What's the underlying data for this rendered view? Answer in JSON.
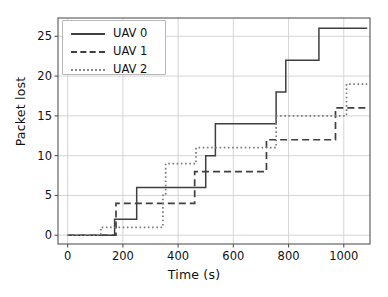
{
  "chart_data": {
    "type": "line",
    "subtype": "step",
    "title": "",
    "xlabel": "Time (s)",
    "ylabel": "Packet lost",
    "xlim": [
      -35,
      1095
    ],
    "ylim": [
      -1.1,
      27.3
    ],
    "xticks": [
      0,
      200,
      400,
      600,
      800,
      1000
    ],
    "yticks": [
      0,
      5,
      10,
      15,
      20,
      25
    ],
    "grid": true,
    "legend_position": "upper left",
    "series": [
      {
        "name": "UAV 0",
        "style": "solid",
        "color": "#3f3f3f",
        "x": [
          0,
          170,
          170,
          175,
          250,
          250,
          500,
          500,
          535,
          535,
          755,
          755,
          790,
          790,
          910,
          910,
          1085
        ],
        "y": [
          0,
          0,
          2,
          2,
          2,
          6,
          6,
          10,
          10,
          14,
          14,
          18,
          18,
          22,
          22,
          26,
          26
        ],
        "steps": [
          {
            "t": 0,
            "value": 0
          },
          {
            "t": 170,
            "value": 2
          },
          {
            "t": 250,
            "value": 6
          },
          {
            "t": 500,
            "value": 10
          },
          {
            "t": 535,
            "value": 14
          },
          {
            "t": 755,
            "value": 18
          },
          {
            "t": 790,
            "value": 22
          },
          {
            "t": 910,
            "value": 26
          }
        ],
        "final_value": 26
      },
      {
        "name": "UAV 1",
        "style": "dashed",
        "color": "#3f3f3f",
        "x": [
          0,
          130,
          130,
          175,
          175,
          460,
          460,
          720,
          720,
          970,
          970,
          1085
        ],
        "y": [
          0,
          0,
          0,
          0,
          4,
          4,
          8,
          8,
          12,
          12,
          16,
          16
        ],
        "steps": [
          {
            "t": 0,
            "value": 0
          },
          {
            "t": 175,
            "value": 4
          },
          {
            "t": 460,
            "value": 8
          },
          {
            "t": 720,
            "value": 12
          },
          {
            "t": 970,
            "value": 16
          }
        ],
        "final_value": 16
      },
      {
        "name": "UAV 2",
        "style": "dotted",
        "color": "#7a7a7a",
        "x": [
          0,
          120,
          120,
          345,
          345,
          355,
          355,
          465,
          465,
          755,
          755,
          1010,
          1010,
          1085
        ],
        "y": [
          0,
          0,
          1,
          1,
          5,
          5,
          9,
          9,
          11,
          11,
          15,
          15,
          19,
          19
        ],
        "steps": [
          {
            "t": 0,
            "value": 0
          },
          {
            "t": 120,
            "value": 1
          },
          {
            "t": 345,
            "value": 5
          },
          {
            "t": 355,
            "value": 9
          },
          {
            "t": 465,
            "value": 11
          },
          {
            "t": 755,
            "value": 15
          },
          {
            "t": 1010,
            "value": 19
          }
        ],
        "final_value": 19
      }
    ]
  },
  "axes": {
    "xlabel": "Time (s)",
    "ylabel": "Packet lost",
    "xtick_labels": [
      "0",
      "200",
      "400",
      "600",
      "800",
      "1000"
    ],
    "ytick_labels": [
      "0",
      "5",
      "10",
      "15",
      "20",
      "25"
    ]
  },
  "legend": {
    "entries": [
      {
        "label": "UAV 0",
        "style": "solid"
      },
      {
        "label": "UAV 1",
        "style": "dashed"
      },
      {
        "label": "UAV 2",
        "style": "dotted"
      }
    ]
  },
  "colors": {
    "background": "#ffffff",
    "grid": "#d0d0d0",
    "spine": "#555555",
    "series_dark": "#3f3f3f",
    "series_light": "#7a7a7a",
    "text": "#111111"
  }
}
